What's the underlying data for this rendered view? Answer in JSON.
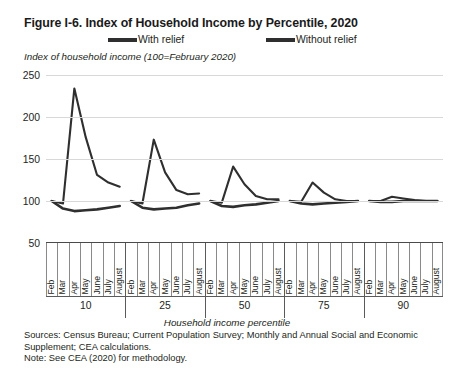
{
  "figure": {
    "title": "Figure I-6. Index of Household Income by Percentile, 2020",
    "y_axis_caption": "Index of household income (100=February 2020)",
    "x_axis_caption": "Household income percentile",
    "sources": "Sources: Census Bureau; Current Population Survey; Monthly and Annual Social and Economic",
    "sources_cont": "Supplement; CEA calculations.",
    "note": "Note: See CEA (2020) for methodology."
  },
  "legend": {
    "items": [
      {
        "label": "With relief",
        "color": "#2f2f2f"
      },
      {
        "label": "Without relief",
        "color": "#2f2f2f"
      }
    ]
  },
  "colors": {
    "series_line": "#2f2f2f",
    "gridline": "#d8d8d8",
    "axis": "#5a5a5a",
    "text": "#231f20"
  },
  "chart_data": {
    "type": "line",
    "title": "Figure I-6. Index of Household Income by Percentile, 2020",
    "subtitle": "",
    "xlabel": "Household income percentile",
    "ylabel": "Index of household income (100=February 2020)",
    "ylim": [
      50,
      250
    ],
    "yticks": [
      50,
      100,
      150,
      200,
      250
    ],
    "grid": true,
    "legend_position": "top-center",
    "panel_categories": [
      "10",
      "25",
      "50",
      "75",
      "90"
    ],
    "x": [
      "Feb",
      "Mar",
      "Apr",
      "May",
      "June",
      "July",
      "August"
    ],
    "panels": [
      {
        "percentile": "10",
        "series": [
          {
            "name": "With relief",
            "values": [
              100,
              97,
              234,
              176,
              131,
              122,
              117
            ]
          },
          {
            "name": "Without relief",
            "values": [
              100,
              91,
              88,
              89,
              90,
              92,
              94
            ]
          }
        ]
      },
      {
        "percentile": "25",
        "series": [
          {
            "name": "With relief",
            "values": [
              100,
              97,
              173,
              134,
              113,
              108,
              109
            ]
          },
          {
            "name": "Without relief",
            "values": [
              100,
              92,
              90,
              91,
              92,
              95,
              97
            ]
          }
        ]
      },
      {
        "percentile": "50",
        "series": [
          {
            "name": "With relief",
            "values": [
              100,
              98,
              141,
              120,
              106,
              102,
              102
            ]
          },
          {
            "name": "Without relief",
            "values": [
              100,
              94,
              93,
              95,
              96,
              98,
              100
            ]
          }
        ]
      },
      {
        "percentile": "75",
        "series": [
          {
            "name": "With relief",
            "values": [
              100,
              99,
              122,
              110,
              102,
              100,
              100
            ]
          },
          {
            "name": "Without relief",
            "values": [
              100,
              97,
              96,
              97,
              98,
              99,
              100
            ]
          }
        ]
      },
      {
        "percentile": "90",
        "series": [
          {
            "name": "With relief",
            "values": [
              100,
              100,
              105,
              103,
              101,
              100,
              100
            ]
          },
          {
            "name": "Without relief",
            "values": [
              100,
              99,
              99,
              100,
              100,
              100,
              100
            ]
          }
        ]
      }
    ]
  }
}
